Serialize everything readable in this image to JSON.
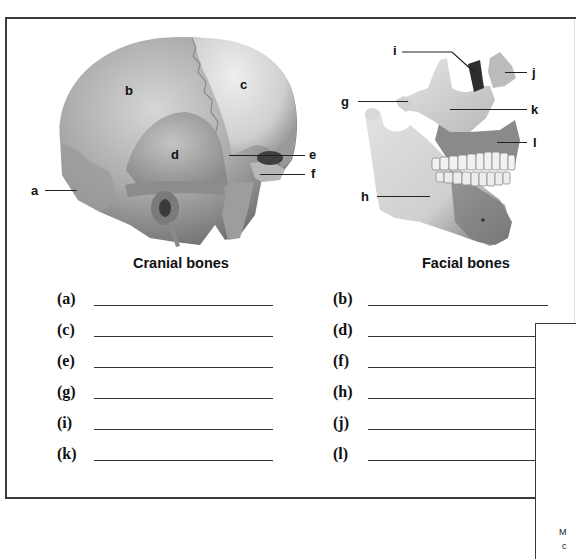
{
  "figures": {
    "cranial": {
      "caption": "Cranial bones",
      "labels": [
        "a",
        "b",
        "c",
        "d",
        "e",
        "f"
      ]
    },
    "facial": {
      "caption": "Facial bones",
      "labels": [
        "g",
        "h",
        "i",
        "j",
        "k",
        "l"
      ]
    }
  },
  "answers": {
    "left": [
      {
        "label": "(a)",
        "value": ""
      },
      {
        "label": "(c)",
        "value": ""
      },
      {
        "label": "(e)",
        "value": ""
      },
      {
        "label": "(g)",
        "value": ""
      },
      {
        "label": "(i)",
        "value": ""
      },
      {
        "label": "(k)",
        "value": ""
      }
    ],
    "right": [
      {
        "label": "(b)",
        "value": ""
      },
      {
        "label": "(d)",
        "value": ""
      },
      {
        "label": "(f)",
        "value": ""
      },
      {
        "label": "(h)",
        "value": ""
      },
      {
        "label": "(j)",
        "value": ""
      },
      {
        "label": "(l)",
        "value": ""
      }
    ]
  },
  "overlap_box": {
    "text_fragments": [
      "M",
      "c"
    ]
  },
  "colors": {
    "frame": "#3a3a3a",
    "bone_light": "#d9d9d9",
    "bone_mid": "#a8a8a8",
    "bone_dark": "#6e6e6e",
    "text": "#111111"
  }
}
